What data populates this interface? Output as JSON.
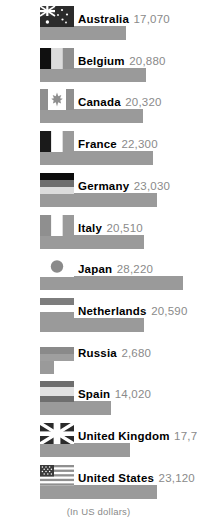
{
  "chart_data": {
    "type": "bar",
    "orientation": "horizontal",
    "title": "",
    "xlabel": "",
    "ylabel": "",
    "footnote": "(In US dollars)",
    "grid": false,
    "legend": false,
    "xlim": [
      0,
      28220
    ],
    "categories": [
      "Australia",
      "Belgium",
      "Canada",
      "France",
      "Germany",
      "Italy",
      "Japan",
      "Netherlands",
      "Russia",
      "Spain",
      "United Kingdom",
      "United States"
    ],
    "values": [
      17070,
      20880,
      20320,
      22300,
      23030,
      20510,
      28220,
      20590,
      2680,
      14020,
      17760,
      23120
    ],
    "value_labels": [
      "17,070",
      "20,880",
      "20,320",
      "22,300",
      "23,030",
      "20,510",
      "28,220",
      "20,590",
      "2,680",
      "14,020",
      "17,760",
      "23,120"
    ],
    "bar_color": "#9a9a9a",
    "rows": [
      {
        "country": "Australia",
        "value": 17070,
        "label": "17,070",
        "flag": "flag-australia-icon"
      },
      {
        "country": "Belgium",
        "value": 20880,
        "label": "20,880",
        "flag": "flag-belgium-icon"
      },
      {
        "country": "Canada",
        "value": 20320,
        "label": "20,320",
        "flag": "flag-canada-icon"
      },
      {
        "country": "France",
        "value": 22300,
        "label": "22,300",
        "flag": "flag-france-icon"
      },
      {
        "country": "Germany",
        "value": 23030,
        "label": "23,030",
        "flag": "flag-germany-icon"
      },
      {
        "country": "Italy",
        "value": 20510,
        "label": "20,510",
        "flag": "flag-italy-icon"
      },
      {
        "country": "Japan",
        "value": 28220,
        "label": "28,220",
        "flag": "flag-japan-icon"
      },
      {
        "country": "Netherlands",
        "value": 20590,
        "label": "20,590",
        "flag": "flag-netherlands-icon"
      },
      {
        "country": "Russia",
        "value": 2680,
        "label": "2,680",
        "flag": "flag-russia-icon"
      },
      {
        "country": "Spain",
        "value": 14020,
        "label": "14,020",
        "flag": "flag-spain-icon"
      },
      {
        "country": "United Kingdom",
        "value": 17760,
        "label": "17,760",
        "flag": "flag-united-kingdom-icon"
      },
      {
        "country": "United States",
        "value": 23120,
        "label": "23,120",
        "flag": "flag-united-states-icon"
      }
    ]
  }
}
